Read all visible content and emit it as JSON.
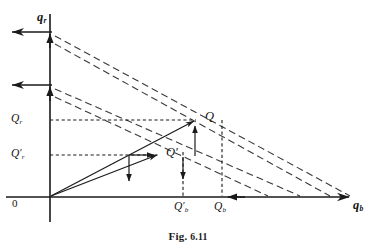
{
  "figure": {
    "caption_prefix": "Fig.",
    "caption_number": "6.11",
    "caption_full": "Fig. 6.11",
    "width": 376,
    "height": 249,
    "background_color": "#ffffff",
    "line_color": "#1a1a1a",
    "dash_color": "#3a3a3a"
  },
  "axes": {
    "origin": {
      "label": "0",
      "x": 50,
      "y": 197
    },
    "vertical": {
      "name": "q",
      "subscript": "r",
      "label": "q_r",
      "x": 50,
      "top_y": 14,
      "bottom_y": 222,
      "label_x": 37,
      "label_y": 12
    },
    "horizontal": {
      "name": "q",
      "subscript": "b",
      "label": "q_b",
      "y": 197,
      "left_x": 6,
      "right_x": 352,
      "label_x": 353,
      "label_y": 200
    }
  },
  "points": [
    {
      "id": "Q",
      "label": "Q",
      "x": 195,
      "y": 120,
      "label_x": 205,
      "label_y": 111
    },
    {
      "id": "Qprime",
      "label": "Q'",
      "x": 159,
      "y": 155,
      "label_x": 166,
      "label_y": 147
    }
  ],
  "vertical_ticks": [
    {
      "id": "Qr",
      "label": "Q_r",
      "base": "Q",
      "subscript": "r",
      "prime": false,
      "y": 120,
      "label_x": 11,
      "label_y": 113
    },
    {
      "id": "Qr_prime",
      "label": "Q'_r",
      "base": "Q",
      "subscript": "r",
      "prime": true,
      "y": 155,
      "label_x": 11,
      "label_y": 148
    }
  ],
  "horizontal_ticks": [
    {
      "id": "Qb_prime",
      "label": "Q'_b",
      "base": "Q",
      "subscript": "b",
      "prime": true,
      "x": 183,
      "label_x": 175,
      "label_y": 202
    },
    {
      "id": "Qb",
      "label": "Q_b",
      "base": "Q",
      "subscript": "b",
      "prime": false,
      "x": 222,
      "label_x": 215,
      "label_y": 202
    }
  ],
  "axis_arrow_markers": {
    "left_arrows_on_y_side": [
      {
        "y": 32,
        "from_x": 52,
        "to_x": 8
      },
      {
        "y": 85,
        "from_x": 52,
        "to_x": 8
      }
    ],
    "right_arrow_on_x": {
      "y": 197,
      "to_x": 352
    },
    "midline_arrow_on_x": {
      "y": 197,
      "x": 232
    },
    "up_arrows_on_y": [
      {
        "x": 50,
        "y": 36
      },
      {
        "x": 50,
        "y": 89
      }
    ]
  },
  "rays": [
    {
      "id": "ray-to-Q",
      "from_x": 50,
      "from_y": 197,
      "to_x": 195,
      "to_y": 120,
      "style": "solid"
    },
    {
      "id": "ray-to-Qprime",
      "from_x": 50,
      "from_y": 197,
      "to_x": 159,
      "to_y": 155,
      "style": "solid"
    }
  ],
  "dashed_budget_lines": [
    {
      "id": "budget-line-1",
      "x1": 55,
      "y1": 36,
      "x2": 352,
      "y2": 197
    },
    {
      "id": "budget-line-2",
      "x1": 55,
      "y1": 43,
      "x2": 330,
      "y2": 197
    },
    {
      "id": "budget-line-3",
      "x1": 55,
      "y1": 89,
      "x2": 300,
      "y2": 197
    },
    {
      "id": "budget-line-4",
      "x1": 55,
      "y1": 96,
      "x2": 270,
      "y2": 197
    }
  ],
  "projection_lines": [
    {
      "id": "proj-Q-horizontal",
      "x1": 50,
      "y1": 120,
      "x2": 195,
      "y2": 120
    },
    {
      "id": "proj-Q-vertical",
      "x1": 222,
      "y1": 120,
      "x2": 222,
      "y2": 197
    },
    {
      "id": "proj-Qprime-horizontal",
      "x1": 50,
      "y1": 155,
      "x2": 159,
      "y2": 155
    },
    {
      "id": "proj-Qprime-vertical",
      "x1": 183,
      "y1": 155,
      "x2": 183,
      "y2": 197
    }
  ],
  "adjustment_arrows": [
    {
      "id": "arrow-up-to-Q",
      "x1": 195,
      "y1": 155,
      "x2": 195,
      "y2": 124,
      "dir": "up"
    },
    {
      "id": "arrow-right-to-Qprime",
      "x1": 128,
      "y1": 155,
      "x2": 155,
      "y2": 155,
      "dir": "right"
    },
    {
      "id": "arrow-down-inner",
      "x1": 128,
      "y1": 155,
      "x2": 128,
      "y2": 183,
      "dir": "down"
    },
    {
      "id": "arrow-down-outer",
      "x1": 183,
      "y1": 155,
      "x2": 183,
      "y2": 180,
      "dir": "down"
    }
  ]
}
